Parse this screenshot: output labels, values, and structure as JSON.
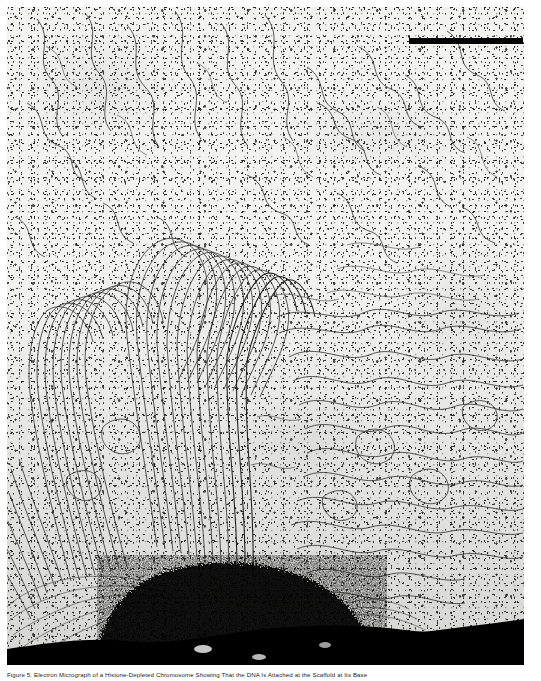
{
  "figure": {
    "kind": "electron-micrograph",
    "caption": "Figure 5. Electron Micrograph of a Histone-Depleted Chromosome Showing That the DNA Is Attached at the Scaffold at Its Base",
    "scale_bar": {
      "label": "",
      "present": true
    },
    "regions": {
      "background": "electron-dense speckled grain field",
      "loops": "radiating DNA loop fibers",
      "core": "dense dark chromosome scaffold at base"
    },
    "colors": {
      "plate_background": "#f2f2f0",
      "fiber_stroke": "#3a3a3a",
      "fiber_dark": "#1e1e1e",
      "scaffold": "#000000",
      "scale_bar": "#000000",
      "caption_text": "#1c1c1c",
      "page_background": "#ffffff"
    }
  }
}
